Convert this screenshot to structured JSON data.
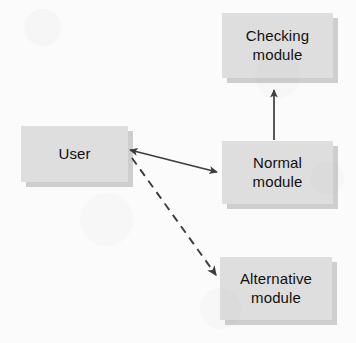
{
  "diagram": {
    "title": "",
    "background_color": "#fbfbfb",
    "node_fill_color": "#dedede",
    "node_shadow_color": "#aaaaaa",
    "edge_color": "#3c3c3c",
    "text_color": "#101010",
    "nodes": [
      {
        "id": "checking-module",
        "label": "Checking\nmodule",
        "x": 222,
        "y": 13,
        "width": 111,
        "height": 65
      },
      {
        "id": "user",
        "label": "User",
        "x": 21,
        "y": 126,
        "width": 107,
        "height": 56
      },
      {
        "id": "normal-module",
        "label": "Normal\nmodule",
        "x": 222,
        "y": 141,
        "width": 111,
        "height": 63
      },
      {
        "id": "alternative-module",
        "label": "Alternative\nmodule",
        "x": 220,
        "y": 257,
        "width": 112,
        "height": 63
      }
    ],
    "edges": [
      {
        "id": "normal-to-checking",
        "from": "normal-module",
        "to": "checking-module",
        "style": "solid",
        "arrowheads": "single",
        "label": ""
      },
      {
        "id": "user-to-normal",
        "from": "user",
        "to": "normal-module",
        "style": "solid",
        "arrowheads": "double",
        "label": ""
      },
      {
        "id": "user-to-alternative",
        "from": "user",
        "to": "alternative-module",
        "style": "dashed",
        "arrowheads": "single",
        "label": ""
      }
    ]
  }
}
